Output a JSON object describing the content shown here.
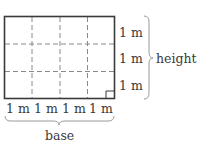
{
  "diagram": {
    "grid": {
      "columns": 4,
      "rows": 3
    },
    "unit_label": "1 m",
    "side_labels": [
      "1 m",
      "1 m",
      "1 m"
    ],
    "bottom_labels": [
      "1 m",
      "1 m",
      "1 m",
      "1 m"
    ],
    "height_label": "height",
    "base_label": "base",
    "colors": {
      "outline": "#3a3a3a",
      "dashed": "#8a8a8a",
      "brace": "#9a9a9a"
    }
  }
}
